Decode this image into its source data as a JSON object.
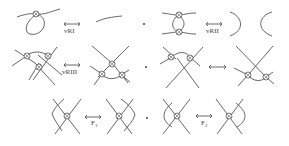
{
  "figure": {
    "moves": [
      {
        "id": "vRI",
        "label": "vRI",
        "row": 1,
        "col": 1
      },
      {
        "id": "vRII",
        "label": "vRII",
        "row": 1,
        "col": 2
      },
      {
        "id": "vRIII",
        "label": "vRIII",
        "row": 2,
        "col": 1
      },
      {
        "id": "mixed",
        "label": "",
        "row": 2,
        "col": 2
      },
      {
        "id": "F1",
        "label": "F",
        "subscript": "1",
        "row": 3,
        "col": 1
      },
      {
        "id": "F2",
        "label": "F",
        "subscript": "2",
        "row": 3,
        "col": 2
      }
    ],
    "separator": ","
  },
  "colors": {
    "stroke": "#555555",
    "background": "#ffffff"
  }
}
